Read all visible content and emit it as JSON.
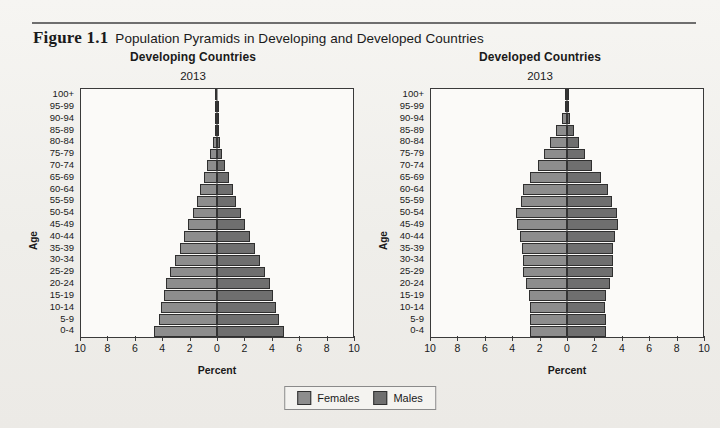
{
  "figure": {
    "label": "Figure 1.1",
    "title": "Population Pyramids in Developing and Developed Countries"
  },
  "legend": {
    "females_label": "Females",
    "males_label": "Males",
    "females_color": "#8d8d8d",
    "males_color": "#6f6f6f"
  },
  "axis": {
    "y_label": "Age",
    "x_label": "Percent",
    "x_ticks": [
      "10",
      "8",
      "6",
      "4",
      "2",
      "0",
      "2",
      "4",
      "6",
      "8",
      "10"
    ],
    "age_groups": [
      "0-4",
      "5-9",
      "10-14",
      "15-19",
      "20-24",
      "25-29",
      "30-34",
      "35-39",
      "40-44",
      "45-49",
      "50-54",
      "55-59",
      "60-64",
      "65-69",
      "70-74",
      "75-79",
      "80-84",
      "85-89",
      "90-94",
      "95-99",
      "100+"
    ]
  },
  "chart_data": [
    {
      "type": "bar",
      "title": "Developing Countries",
      "subtitle": "2013",
      "year": "2013",
      "orientation": "population-pyramid",
      "xlabel": "Percent",
      "ylabel": "Age",
      "xlim": [
        -10,
        10
      ],
      "x_ticks": [
        10,
        8,
        6,
        4,
        2,
        0,
        2,
        4,
        6,
        8,
        10
      ],
      "grid": false,
      "legend_position": "bottom-center",
      "categories": [
        "0-4",
        "5-9",
        "10-14",
        "15-19",
        "20-24",
        "25-29",
        "30-34",
        "35-39",
        "40-44",
        "45-49",
        "50-54",
        "55-59",
        "60-64",
        "65-69",
        "70-74",
        "75-79",
        "80-84",
        "85-89",
        "90-94",
        "95-99",
        "100+"
      ],
      "series": [
        {
          "name": "Females",
          "side": "left",
          "values": [
            4.6,
            4.3,
            4.1,
            3.9,
            3.75,
            3.45,
            3.1,
            2.75,
            2.45,
            2.1,
            1.8,
            1.5,
            1.25,
            0.95,
            0.72,
            0.52,
            0.33,
            0.17,
            0.07,
            0.02,
            0.01
          ]
        },
        {
          "name": "Males",
          "side": "right",
          "values": [
            4.9,
            4.55,
            4.35,
            4.1,
            3.9,
            3.55,
            3.15,
            2.8,
            2.45,
            2.05,
            1.75,
            1.42,
            1.15,
            0.85,
            0.6,
            0.4,
            0.24,
            0.11,
            0.04,
            0.01,
            0.0
          ]
        }
      ]
    },
    {
      "type": "bar",
      "title": "Developed Countries",
      "subtitle": "2013",
      "year": "2013",
      "orientation": "population-pyramid",
      "xlabel": "Percent",
      "ylabel": "Age",
      "xlim": [
        -10,
        10
      ],
      "x_ticks": [
        10,
        8,
        6,
        4,
        2,
        0,
        2,
        4,
        6,
        8,
        10
      ],
      "grid": false,
      "legend_position": "bottom-center",
      "categories": [
        "0-4",
        "5-9",
        "10-14",
        "15-19",
        "20-24",
        "25-29",
        "30-34",
        "35-39",
        "40-44",
        "45-49",
        "50-54",
        "55-59",
        "60-64",
        "65-69",
        "70-74",
        "75-79",
        "80-84",
        "85-89",
        "90-94",
        "95-99",
        "100+"
      ],
      "series": [
        {
          "name": "Females",
          "side": "left",
          "values": [
            2.7,
            2.72,
            2.7,
            2.8,
            3.05,
            3.25,
            3.25,
            3.3,
            3.45,
            3.7,
            3.75,
            3.4,
            3.2,
            2.7,
            2.1,
            1.7,
            1.25,
            0.8,
            0.38,
            0.12,
            0.03
          ]
        },
        {
          "name": "Males",
          "side": "right",
          "values": [
            2.85,
            2.85,
            2.8,
            2.9,
            3.15,
            3.35,
            3.35,
            3.4,
            3.5,
            3.75,
            3.7,
            3.3,
            3.05,
            2.5,
            1.85,
            1.35,
            0.9,
            0.5,
            0.2,
            0.05,
            0.01
          ]
        }
      ]
    }
  ]
}
